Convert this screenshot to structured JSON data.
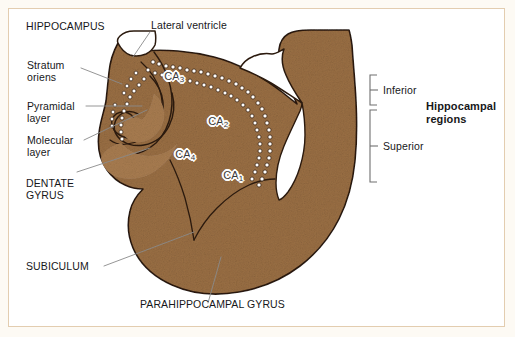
{
  "figure": {
    "title_label": "HIPPOCAMPUS",
    "background_color": "#ffffff",
    "matte_color": "#fdfaf4",
    "frame_color": "#e3cdb0",
    "tissue_color": "#9a6f44",
    "tissue_color_dark": "#8a5f36",
    "tissue_color_light": "#a87c50",
    "outline_color": "#2b1a0e",
    "leader_color": "#8a8a8a",
    "text_color": "#17171a"
  },
  "labels": {
    "hippocampus": "HIPPOCAMPUS",
    "lateral_ventricle": "Lateral ventricle",
    "stratum_oriens_line1": "Stratum",
    "stratum_oriens_line2": "oriens",
    "pyramidal_line1": "Pyramidal",
    "pyramidal_line2": "layer",
    "molecular_line1": "Molecular",
    "molecular_line2": "layer",
    "dentate_line1": "DENTATE",
    "dentate_line2": "GYRUS",
    "subiculum": "SUBICULUM",
    "parahippocampal_gyrus": "PARAHIPPOCAMPAL GYRUS"
  },
  "ca_fields": [
    {
      "id": "ca3",
      "text": "CA",
      "sub": "3"
    },
    {
      "id": "ca2",
      "text": "CA",
      "sub": "2"
    },
    {
      "id": "ca4",
      "text": "CA",
      "sub": "4"
    },
    {
      "id": "ca1",
      "text": "CA",
      "sub": "1"
    }
  ],
  "ca3_text": "CA",
  "ca3_sub": "3",
  "ca2_text": "CA",
  "ca2_sub": "2",
  "ca4_text": "CA",
  "ca4_sub": "4",
  "ca1_text": "CA",
  "ca1_sub": "1",
  "bracket_group": {
    "heading_line1": "Hippocampal",
    "heading_line2": "regions",
    "inferior": "Inferior",
    "superior": "Superior"
  }
}
